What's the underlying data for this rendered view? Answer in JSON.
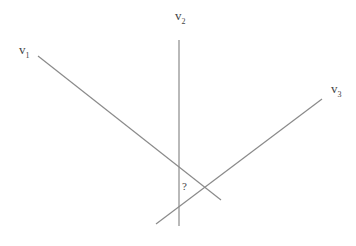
{
  "diagram": {
    "lines": [
      {
        "id": "v1",
        "x1": 38,
        "y1": 56,
        "x2": 221,
        "y2": 200
      },
      {
        "id": "v2",
        "x1": 179,
        "y1": 40,
        "x2": 179,
        "y2": 226
      },
      {
        "id": "v3",
        "x1": 322,
        "y1": 99,
        "x2": 156,
        "y2": 224
      }
    ],
    "labels": {
      "v1": {
        "base": "v",
        "sub": "1"
      },
      "v2": {
        "base": "v",
        "sub": "2"
      },
      "v3": {
        "base": "v",
        "sub": "3"
      },
      "unknown": "?"
    },
    "stroke_color": "#888888"
  }
}
